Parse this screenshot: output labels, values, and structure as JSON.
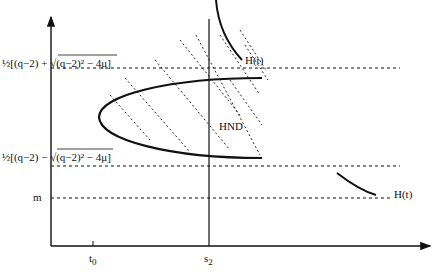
{
  "diagram": {
    "axes": {
      "x_ticks": [
        {
          "label": "t",
          "sub": "0"
        },
        {
          "label": "s",
          "sub": "2"
        }
      ]
    },
    "levels": {
      "upper": {
        "prefix": "½[(q−2) + ",
        "radical": "√(q−2)² − 4μ",
        "suffix": "]"
      },
      "lower": {
        "prefix": "½[(q−2) − ",
        "radical": "√(q−2)² − 4μ",
        "suffix": "]"
      },
      "m": "m"
    },
    "curves": {
      "h_upper": "H(t)",
      "h_lower": "H(t)"
    },
    "region": {
      "label": "HND"
    },
    "colors": {
      "ink": "#111111",
      "background": "#ffffff"
    }
  }
}
